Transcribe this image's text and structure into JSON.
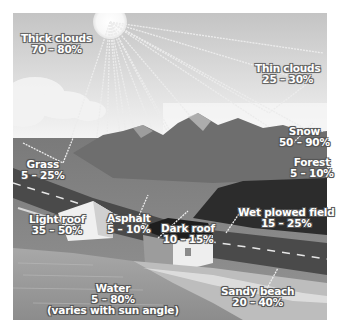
{
  "figure": {
    "colors": {
      "sky_top": "#c8c8c8",
      "sky_bottom": "#f2f2f2",
      "sun": "#fbfbfb",
      "mountain": "#6e6e6e",
      "grass": "#8a8a8a",
      "road": "#4a4a4a",
      "field": "#2e2e2e",
      "water": "#9a9a9a",
      "beach": "#bdbdbd",
      "ray": "#e8e8e8"
    },
    "labels": {
      "thick_clouds": {
        "name": "Thick clouds",
        "value": "70 – 80%"
      },
      "thin_clouds": {
        "name": "Thin clouds",
        "value": "25 – 30%"
      },
      "snow": {
        "name": "Snow",
        "value": "50 – 90%"
      },
      "forest": {
        "name": "Forest",
        "value": "5 – 10%"
      },
      "grass": {
        "name": "Grass",
        "value": "5 – 25%"
      },
      "wet_plowed_field": {
        "name": "Wet plowed field",
        "value": "15 – 25%"
      },
      "light_roof": {
        "name": "Light roof",
        "value": "35 – 50%"
      },
      "asphalt": {
        "name": "Asphalt",
        "value": "5 – 10%"
      },
      "dark_roof": {
        "name": "Dark roof",
        "value": "10 – 15%"
      },
      "water": {
        "name": "Water",
        "value": "5 – 80%",
        "note": "(varies with sun angle)"
      },
      "sandy_beach": {
        "name": "Sandy beach",
        "value": "20 – 40%"
      }
    }
  }
}
